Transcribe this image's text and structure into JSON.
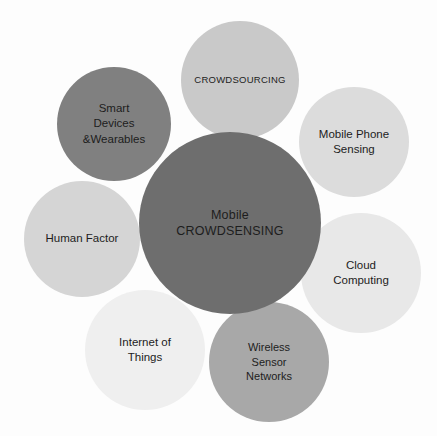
{
  "diagram": {
    "background_color": "#fdfdfd",
    "text_color": "#1d1d1d",
    "canvas": {
      "width": 437,
      "height": 436
    },
    "core": {
      "id": "core",
      "label": "Mobile\nCROWDSENSING",
      "color": "#6e6e6e",
      "cx": 230,
      "cy": 223,
      "r": 91
    },
    "satellites": [
      {
        "id": "crowdsourcing",
        "label": "CROWDSOURCING",
        "color": "#c9c9c9",
        "cx": 240,
        "cy": 80,
        "r": 59,
        "position": "top"
      },
      {
        "id": "mobile-phone-sensing",
        "label": "Mobile Phone\nSensing",
        "color": "#dcdcdc",
        "cx": 354,
        "cy": 142,
        "r": 55,
        "position": "top-right"
      },
      {
        "id": "cloud-computing",
        "label": "Cloud\nComputing",
        "color": "#e8e8e8",
        "cx": 361,
        "cy": 273,
        "r": 60,
        "position": "right"
      },
      {
        "id": "wireless-sensor-networks",
        "label": "Wireless\nSensor\nNetworks",
        "color": "#a8a8a8",
        "cx": 269,
        "cy": 362,
        "r": 60,
        "position": "bottom-right"
      },
      {
        "id": "internet-of-things",
        "label": "Internet of\nThings",
        "color": "#efefef",
        "cx": 145,
        "cy": 350,
        "r": 60,
        "position": "bottom-left"
      },
      {
        "id": "human-factor",
        "label": "Human Factor",
        "color": "#d5d5d5",
        "cx": 82,
        "cy": 239,
        "r": 58,
        "position": "left"
      },
      {
        "id": "smart-devices-wearables",
        "label": "Smart\nDevices\n&Wearables",
        "color": "#808080",
        "cx": 114,
        "cy": 124,
        "r": 57,
        "position": "top-left"
      }
    ]
  }
}
